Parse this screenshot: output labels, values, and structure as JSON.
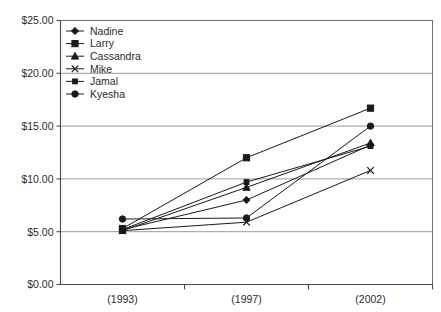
{
  "chart_data": {
    "type": "line",
    "title": "",
    "subtitle": "",
    "xlabel": "",
    "ylabel": "",
    "categories": [
      "(1993)",
      "(1997)",
      "(2002)"
    ],
    "ylim": [
      0,
      25
    ],
    "ytick_values": [
      0,
      5,
      10,
      15,
      20,
      25
    ],
    "ytick_labels": [
      "$0.00",
      "$5.00",
      "$10.00",
      "$15.00",
      "$20.00",
      "$25.00"
    ],
    "grid": true,
    "grid_axis": "y",
    "legend_position": "top-left-inside",
    "value_prefix": "$",
    "series": [
      {
        "name": "Nadine",
        "marker": "diamond",
        "values": [
          5.2,
          8.0,
          13.2
        ]
      },
      {
        "name": "Larry",
        "marker": "square",
        "values": [
          5.3,
          12.0,
          16.7
        ]
      },
      {
        "name": "Cassandra",
        "marker": "triangle",
        "values": [
          5.1,
          9.2,
          13.4
        ]
      },
      {
        "name": "Mike",
        "marker": "cross",
        "values": [
          5.1,
          5.9,
          10.8
        ]
      },
      {
        "name": "Jamal",
        "marker": "small-square",
        "values": [
          5.2,
          9.7,
          13.1
        ]
      },
      {
        "name": "Kyesha",
        "marker": "circle",
        "values": [
          6.2,
          6.3,
          15.0
        ]
      }
    ]
  },
  "legend": {
    "items": [
      {
        "label": "Nadine"
      },
      {
        "label": "Larry"
      },
      {
        "label": "Cassandra"
      },
      {
        "label": "Mike"
      },
      {
        "label": "Jamal"
      },
      {
        "label": "Kyesha"
      }
    ]
  },
  "colors": {
    "ink": "#1a1a1a",
    "grid": "#9a9a9a",
    "frame": "#6e6e6e",
    "background": "#ffffff"
  }
}
